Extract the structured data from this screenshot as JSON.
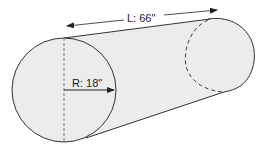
{
  "diagram": {
    "type": "cylinder-dimensions",
    "length_label": "L: 66\"",
    "radius_label": "R: 18\"",
    "length": {
      "symbol": "L",
      "value": 66,
      "unit": "in"
    },
    "radius": {
      "symbol": "R",
      "value": 18,
      "unit": "in"
    }
  },
  "colors": {
    "fill": "#ececec",
    "stroke": "#333333",
    "background": "#ffffff"
  }
}
